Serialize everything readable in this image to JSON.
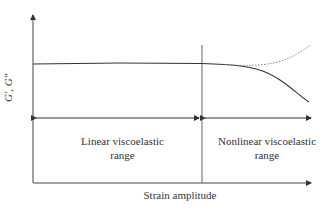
{
  "diagram": {
    "y_axis_label": "G′, G″",
    "x_axis_label": "Strain amplitude",
    "regions": [
      {
        "label_line1": "Linear viscoelastic",
        "label_line2": "range"
      },
      {
        "label_line1": "Nonlinear viscoelastic",
        "label_line2": "range"
      }
    ],
    "curves": [
      {
        "name": "G-prime",
        "style": "solid",
        "behavior": "plateau then decreases"
      },
      {
        "name": "G-double-prime",
        "style": "dotted",
        "behavior": "plateau then increases"
      }
    ],
    "colors": {
      "line": "#333333",
      "divider": "#555555",
      "dotted": "#777777"
    }
  }
}
